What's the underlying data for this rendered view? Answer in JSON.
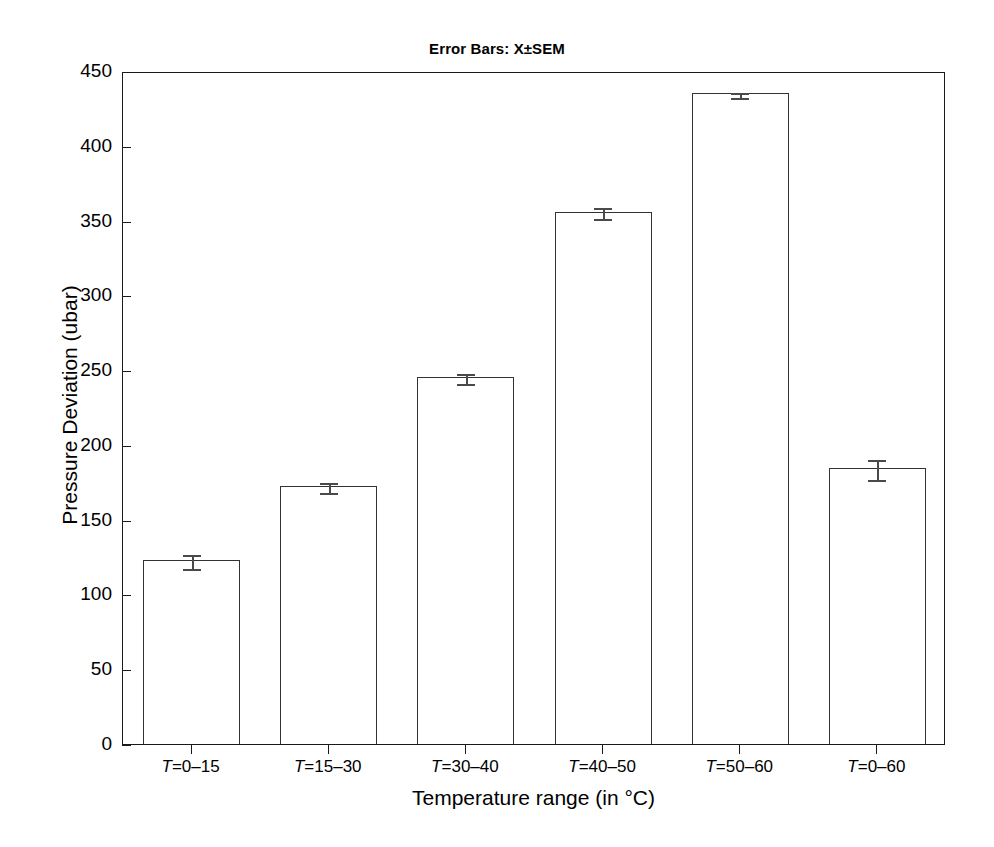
{
  "chart_data": {
    "type": "bar",
    "title": "Error Bars: X±SEM",
    "xlabel": "Temperature range (in °C)",
    "ylabel": "Pressure Deviation (ubar)",
    "categories": [
      "T=0–15",
      "T=15–30",
      "T=30–40",
      "T=40–50",
      "T=50–60",
      "T=0–60"
    ],
    "category_parts": [
      {
        "var": "T",
        "rest": "=0–15"
      },
      {
        "var": "T",
        "rest": "=15–30"
      },
      {
        "var": "T",
        "rest": "=30–40"
      },
      {
        "var": "T",
        "rest": "=40–50"
      },
      {
        "var": "T",
        "rest": "=50–60"
      },
      {
        "var": "T",
        "rest": "=0–60"
      }
    ],
    "values": [
      123,
      172.5,
      245.5,
      356,
      435,
      184.5
    ],
    "errors": [
      4.5,
      3.5,
      3.5,
      3.5,
      1.5,
      6.5
    ],
    "error_type": "SEM",
    "ylim": [
      0,
      450
    ],
    "yticks": [
      0,
      50,
      100,
      150,
      200,
      250,
      300,
      350,
      400,
      450
    ],
    "ytick_labels": [
      "0",
      "50",
      "100",
      "150",
      "200",
      "250",
      "300",
      "350",
      "400",
      "450"
    ],
    "grid": false,
    "legend": false,
    "bar_facecolor": "#ffffff",
    "bar_edgecolor": "#333333",
    "error_color": "#4a4a4a",
    "axis_color": "#1a1a1a"
  }
}
